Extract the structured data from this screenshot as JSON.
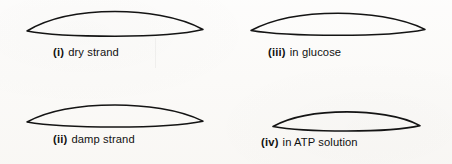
{
  "figure": {
    "background_color": "#fbfaf8",
    "stroke_color": "#141414",
    "panels": [
      {
        "key": "i",
        "numeral": "(i)",
        "label": "dry strand",
        "shape": "lens-outline",
        "width": 178,
        "height": 24,
        "stroke_width": 1.5,
        "description": "pointed oval, widest and thickest"
      },
      {
        "key": "iii",
        "numeral": "(iii)",
        "label": "in glucose",
        "shape": "lens-outline",
        "width": 176,
        "height": 21,
        "stroke_width": 1.5,
        "description": "pointed oval, slightly flatter"
      },
      {
        "key": "ii",
        "numeral": "(ii)",
        "label": "damp strand",
        "shape": "lens-outline",
        "width": 178,
        "height": 22,
        "stroke_width": 1.5,
        "description": "pointed oval, moderately flat"
      },
      {
        "key": "iv",
        "numeral": "(iv)",
        "label": "in ATP solution",
        "shape": "lens-outline",
        "width": 149,
        "height": 19,
        "stroke_width": 1.6,
        "description": "pointed oval, narrowest and flattest"
      }
    ]
  }
}
